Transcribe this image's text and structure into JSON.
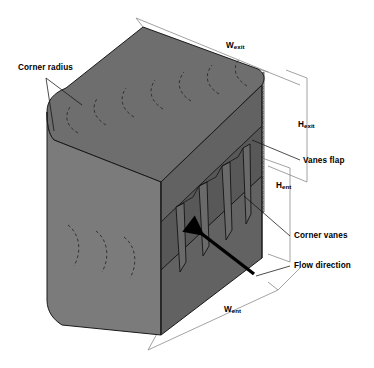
{
  "figure": {
    "type": "isometric-engineering-diagram",
    "background_color": "#ffffff",
    "line_color": "#000000",
    "body_fill": "#6e6e6e",
    "body_fill_light": "#7b7b7b",
    "body_fill_dark": "#626262",
    "mesh_fill": "#c9c9c9",
    "dimension_line_color": "#8a8a8a",
    "arrow_color": "#000000"
  },
  "labels": {
    "corner_radius": "Corner radius",
    "vanes_flap": "Vanes flap",
    "corner_vanes": "Corner vanes",
    "flow_direction": "Flow direction",
    "w_exit_base": "W",
    "w_exit_sub": "exit",
    "h_exit_base": "H",
    "h_exit_sub": "exit",
    "h_ent_base": "H",
    "h_ent_sub": "ent",
    "w_ent_base": "W",
    "w_ent_sub": "ent"
  },
  "dimensions": [
    {
      "name": "W_exit",
      "label": "Wexit",
      "orientation": "top-edge",
      "axis": "width-exit"
    },
    {
      "name": "H_exit",
      "label": "Hexit",
      "orientation": "vertical-right",
      "axis": "height-exit"
    },
    {
      "name": "H_ent",
      "label": "Hent",
      "orientation": "vertical-right",
      "axis": "height-entrance"
    },
    {
      "name": "W_ent",
      "label": "Went",
      "orientation": "bottom-edge",
      "axis": "width-entrance"
    }
  ],
  "annotations": [
    {
      "name": "corner-radius",
      "text": "Corner radius",
      "leader_count": 2,
      "target": "rounded-vertical-corner"
    },
    {
      "name": "vanes-flap",
      "text": "Vanes flap",
      "leader_count": 1,
      "target": "mesh-panel"
    },
    {
      "name": "corner-vanes",
      "text": "Corner vanes",
      "leader_count": 1,
      "target": "internal-vane-blades"
    },
    {
      "name": "flow-direction",
      "text": "Flow direction",
      "leader_count": 1,
      "target": "black-arrow"
    }
  ],
  "geometry": {
    "top_face_arcs": 7,
    "left_face_arcs": 3,
    "corner_vanes": 4,
    "mesh_panel_pattern": "crosshatch",
    "arrow_direction": "up-left"
  }
}
